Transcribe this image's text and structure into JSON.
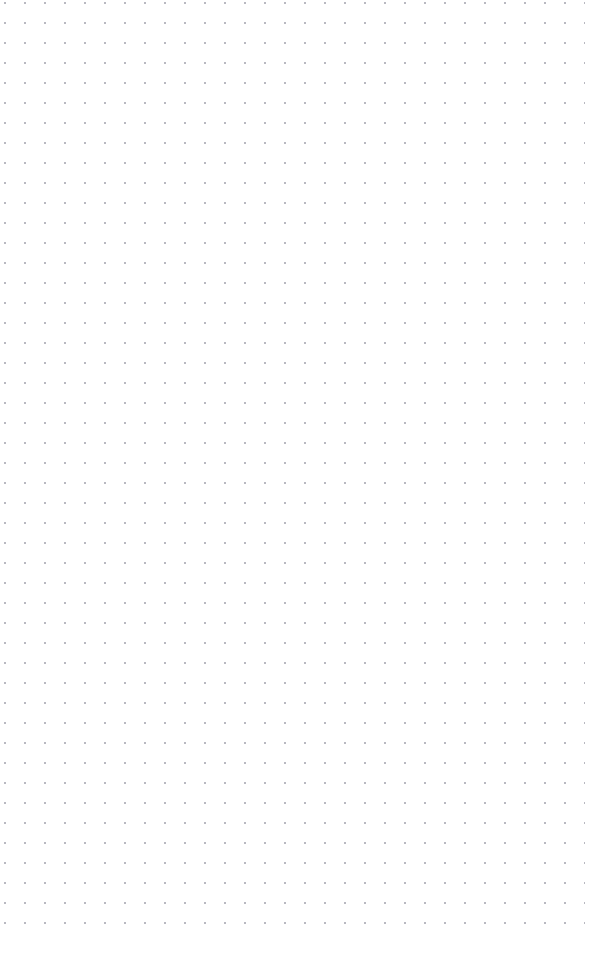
{
  "page": {
    "kind": "dot-grid-page",
    "width": 605,
    "height": 960,
    "background_color": "#ffffff",
    "content_text": ""
  },
  "grid": {
    "dot_color": "#b9b9c1",
    "dot_radius_px": 0.75,
    "spacing_x_px": 20,
    "spacing_y_px": 20,
    "origin_x_px": 15,
    "origin_y_px": 33,
    "columns": 29,
    "rows": 45,
    "first_dot_x_px": 15,
    "first_dot_y_px": 33,
    "last_dot_x_px": 575,
    "last_dot_y_px": 923,
    "margin_left_px": 15,
    "margin_right_px": 30,
    "margin_top_px": 33,
    "margin_bottom_px": 37
  }
}
